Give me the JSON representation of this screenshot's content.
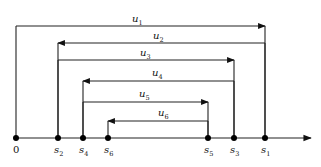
{
  "diagram": {
    "type": "interval-arrow-diagram",
    "axis": {
      "y": 138,
      "x_start": 16,
      "x_end": 311,
      "color": "#222222"
    },
    "points": [
      {
        "id": "0",
        "label": "0",
        "sub": "",
        "x": 16
      },
      {
        "id": "s2",
        "label": "s",
        "sub": "2",
        "x": 58
      },
      {
        "id": "s4",
        "label": "s",
        "sub": "4",
        "x": 83
      },
      {
        "id": "s6",
        "label": "s",
        "sub": "6",
        "x": 108
      },
      {
        "id": "s5",
        "label": "s",
        "sub": "5",
        "x": 208
      },
      {
        "id": "s3",
        "label": "s",
        "sub": "3",
        "x": 234
      },
      {
        "id": "s1",
        "label": "s",
        "sub": "1",
        "x": 265
      }
    ],
    "arrows": [
      {
        "id": "u1",
        "label": "u",
        "sub": "1",
        "from": 16,
        "to": 265,
        "y": 26,
        "label_x": 132,
        "label_y": 22
      },
      {
        "id": "u2",
        "label": "u",
        "sub": "2",
        "from": 265,
        "to": 58,
        "y": 43,
        "label_x": 153,
        "label_y": 39
      },
      {
        "id": "u3",
        "label": "u",
        "sub": "3",
        "from": 58,
        "to": 234,
        "y": 60,
        "label_x": 140,
        "label_y": 56
      },
      {
        "id": "u4",
        "label": "u",
        "sub": "4",
        "from": 234,
        "to": 83,
        "y": 81,
        "label_x": 152,
        "label_y": 76
      },
      {
        "id": "u5",
        "label": "u",
        "sub": "5",
        "from": 83,
        "to": 208,
        "y": 102,
        "label_x": 139,
        "label_y": 97
      },
      {
        "id": "u6",
        "label": "u",
        "sub": "6",
        "from": 208,
        "to": 108,
        "y": 121,
        "label_x": 158,
        "label_y": 116
      }
    ]
  }
}
